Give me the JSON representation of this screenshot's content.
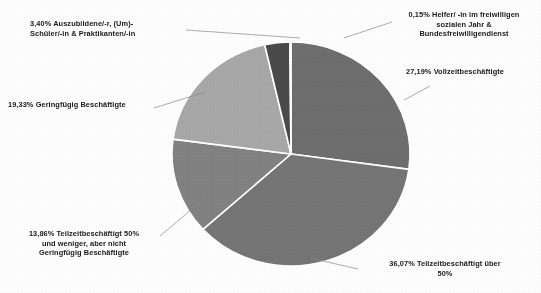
{
  "chart_data": {
    "type": "pie",
    "title": "",
    "subtitle": "",
    "xlabel": "",
    "ylabel": "",
    "legend_position": "none",
    "grid": false,
    "start_angle_deg": 0,
    "direction": "clockwise",
    "value_unit": "percent",
    "decimal_separator": ",",
    "categories": [
      "Vollzeitbeschäftigte",
      "Teilzeitbeschäftigt über 50%",
      "Teilzeitbeschäftigt 50% und weniger, aber nicht Geringfügig Beschäftigte",
      "Geringfügig Beschäftigte",
      "Auszubildene/-r, (Um)-Schüler/-in & Praktikanten/-in",
      "Helfer/ -in im freiwilligen sozialen Jahr & Bundesfreiwilligendienst"
    ],
    "values": [
      27.19,
      36.07,
      13.86,
      19.33,
      3.4,
      0.15
    ],
    "colors": [
      "#6e6e6e",
      "#757575",
      "#828282",
      "#a8a8a8",
      "#4a4a4a",
      "#2a2a2a"
    ],
    "total": 100.0,
    "slices": [
      {
        "id": "vollzeit",
        "value": 27.19,
        "value_text": "27,19%",
        "name": "Vollzeitbeschäftigte",
        "label_text": "27,19% Vollzeitbeschäftigte",
        "color": "#6e6e6e"
      },
      {
        "id": "teilzeit-ueber-50",
        "value": 36.07,
        "value_text": "36,07%",
        "name": "Teilzeitbeschäftigt über 50%",
        "label_text": "36,07%  Teilzeitbeschäftigt über\n50%",
        "color": "#757575"
      },
      {
        "id": "teilzeit-50-und-weniger",
        "value": 13.86,
        "value_text": "13,86%",
        "name": "Teilzeitbeschäftigt 50% und weniger, aber nicht Geringfügig Beschäftigte",
        "label_text": "13,86% Teilzeitbeschäftigt 50%\nund weniger, aber nicht\nGeringfügig Beschäftigte",
        "color": "#828282"
      },
      {
        "id": "geringfuegig",
        "value": 19.33,
        "value_text": "19,33%",
        "name": "Geringfügig Beschäftigte",
        "label_text": "19,33% Geringfügig Beschäftigte",
        "color": "#a8a8a8"
      },
      {
        "id": "auszubildende",
        "value": 3.4,
        "value_text": "3,40%",
        "name": "Auszubildene/-r, (Um)-Schüler/-in & Praktikanten/-in",
        "label_text": "3,40% Auszubildene/-r, (Um)-\nSchüler/-in & Praktikanten/-in",
        "color": "#4a4a4a"
      },
      {
        "id": "helfer-fsj-bfd",
        "value": 0.15,
        "value_text": "0,15%",
        "name": "Helfer/ -in im freiwilligen sozialen Jahr & Bundesfreiwilligendienst",
        "label_text": "0,15% Helfer/ -in im freiwilligen\nsozialen Jahr &\nBundesfreiwilligendienst",
        "color": "#2a2a2a"
      }
    ]
  },
  "geometry": {
    "center_x": 291,
    "center_y": 154,
    "radius_x": 119,
    "radius_y": 112,
    "separator_color": "#ffffff",
    "separator_width": 1.6,
    "leader_color": "#8a8a8a"
  }
}
